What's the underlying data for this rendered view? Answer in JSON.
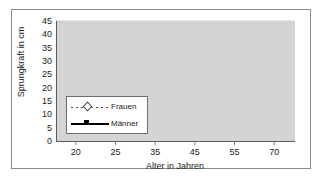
{
  "chart_data": {
    "type": "line",
    "title": "",
    "xlabel": "Alter in Jahren",
    "ylabel": "Sprungkraft in cm",
    "categories": [
      "20",
      "25",
      "35",
      "45",
      "55",
      "70"
    ],
    "xticks": [
      "20",
      "25",
      "35",
      "45",
      "55",
      "70"
    ],
    "yticks": [
      "0",
      "5",
      "10",
      "15",
      "20",
      "25",
      "30",
      "35",
      "40",
      "45"
    ],
    "ylim": [
      0,
      45
    ],
    "grid": true,
    "legend_position": "inside-lower-left",
    "series": [
      {
        "name": "Frauen",
        "values": [
          33.3,
          29.3,
          27.2,
          23.5,
          20.3,
          15.2
        ],
        "line_style": "dotted",
        "marker": "diamond-open",
        "color": "#4a4a4a"
      },
      {
        "name": "Männer",
        "values": [
          42.0,
          41.8,
          39.3,
          37.7,
          31.3,
          24.6
        ],
        "line_style": "solid",
        "marker": "square-filled",
        "color": "#000000"
      }
    ]
  },
  "legend": {
    "items": [
      {
        "label": "Frauen"
      },
      {
        "label": "Männer"
      }
    ]
  },
  "colors": {
    "plot_background": "#d4d4d4",
    "gridline": "#bcbcbc",
    "axis": "#5a5a5a",
    "frame": "#8a8a8a",
    "page_background": "#ffffff",
    "text": "#1a1a1a"
  }
}
